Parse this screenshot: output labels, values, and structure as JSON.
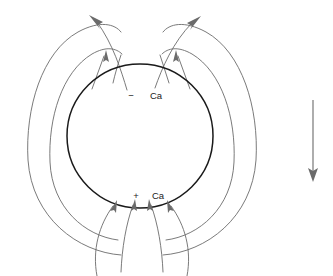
{
  "figure": {
    "name": "dipole-field-diagram",
    "background_color": "#ffffff",
    "width": 333,
    "height": 276
  },
  "labels": {
    "top": {
      "sign": "−",
      "text": "Ca",
      "x": 132,
      "y": 96
    },
    "bottom": {
      "sign": "+",
      "text": "Ca",
      "x": 132,
      "y": 197
    }
  },
  "body": {
    "name": "central-sphere",
    "center_x": 140,
    "center_y": 136,
    "radius_x": 73,
    "radius_y": 72,
    "stroke_color": "#1a1a1a"
  },
  "field": {
    "line_color": "#6b6b6b",
    "arrow_color": "#6b6b6b",
    "direction_top": "outward-upward",
    "direction_bottom": "inward-upward",
    "loop_count_left": 2,
    "loop_count_right": 2,
    "top_arrow_count": 2,
    "inner_top_arrow_count": 4,
    "bottom_arrow_count": 4
  },
  "scale_arrow": {
    "name": "downward-arrow",
    "x": 313,
    "y_start": 100,
    "y_end": 180,
    "direction": "down",
    "color": "#6b6b6b"
  }
}
